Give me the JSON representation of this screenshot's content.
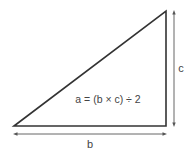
{
  "diagram": {
    "type": "right-triangle-area",
    "formula": "a = (b × c) ÷ 2",
    "base_label": "b",
    "height_label": "c",
    "colors": {
      "stroke": "#333333",
      "arrow": "#555555",
      "text": "#444444",
      "background": "#ffffff"
    }
  }
}
